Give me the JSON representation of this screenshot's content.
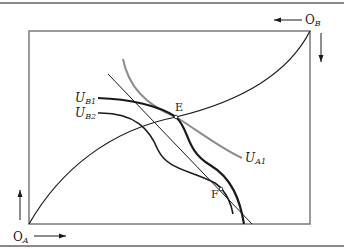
{
  "diagram": {
    "type": "edgeworth-box",
    "origins": {
      "A": {
        "base": "O",
        "sub": "A"
      },
      "B": {
        "base": "O",
        "sub": "B"
      }
    },
    "points": {
      "E": "E",
      "F": "F"
    },
    "curves": {
      "UB1": {
        "base": "U",
        "sub": "B1"
      },
      "UB2": {
        "base": "U",
        "sub": "B2"
      },
      "UA1": {
        "base": "U",
        "sub": "A1"
      }
    },
    "colors": {
      "frame": "#7a7a7a",
      "ink": "#1a1a1a",
      "ua1": "#8c8c8c",
      "rule": "#8a8a8a"
    }
  }
}
